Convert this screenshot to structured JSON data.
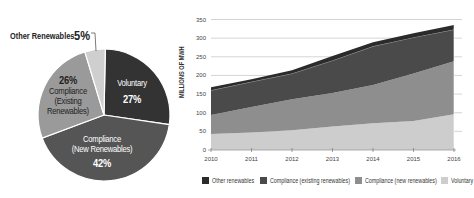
{
  "pie": {
    "slices": [
      {
        "name": "Voluntary",
        "label_lines": [
          "Voluntary"
        ],
        "percent": "27%",
        "value": 27,
        "color": "#333333"
      },
      {
        "name": "Compliance (New Renewables)",
        "label_lines": [
          "Compliance",
          "(New Renewables)"
        ],
        "percent": "42%",
        "value": 42,
        "color": "#555555"
      },
      {
        "name": "Compliance (Existing Renewables)",
        "label_lines": [
          "Compliance",
          "(Existing",
          "Renewables)"
        ],
        "percent": "26%",
        "value": 26,
        "color": "#9a9a9a"
      },
      {
        "name": "Other Renewables",
        "label_lines": [
          "Other Renewables"
        ],
        "percent": "5%",
        "value": 5,
        "color": "#cfcfcf"
      }
    ]
  },
  "area": {
    "ylabel": "MILLIONS OF MWH",
    "yticks": [
      "0",
      "50",
      "100",
      "150",
      "200",
      "250",
      "300",
      "350"
    ],
    "xticks": [
      "2010",
      "2011",
      "2012",
      "2013",
      "2014",
      "2015",
      "2016"
    ],
    "legend": [
      {
        "label": "Other renewables",
        "color": "#2b2b2b"
      },
      {
        "label": "Compliance (existing renewables)",
        "color": "#4a4a4a"
      },
      {
        "label": "Compliance (new renewables)",
        "color": "#8e8e8e"
      },
      {
        "label": "Voluntary",
        "color": "#cdcdcd"
      }
    ]
  },
  "chart_data": [
    {
      "type": "pie",
      "title": "",
      "categories": [
        "Voluntary",
        "Compliance (New Renewables)",
        "Compliance (Existing Renewables)",
        "Other Renewables"
      ],
      "values": [
        27,
        42,
        26,
        5
      ],
      "unit": "%"
    },
    {
      "type": "area",
      "stacked": true,
      "title": "",
      "xlabel": "",
      "ylabel": "MILLIONS OF MWH",
      "x": [
        2010,
        2011,
        2012,
        2013,
        2014,
        2015,
        2016
      ],
      "ylim": [
        0,
        350
      ],
      "yticks": [
        0,
        50,
        100,
        150,
        200,
        250,
        300,
        350
      ],
      "grid": "horizontal",
      "legend_position": "bottom",
      "series": [
        {
          "name": "Voluntary",
          "values": [
            43,
            47,
            53,
            63,
            72,
            78,
            96
          ]
        },
        {
          "name": "Compliance (new renewables)",
          "values": [
            51,
            68,
            83,
            90,
            102,
            127,
            142
          ]
        },
        {
          "name": "Compliance (existing renewables)",
          "values": [
            66,
            68,
            69,
            87,
            104,
            97,
            85
          ]
        },
        {
          "name": "Other renewables",
          "values": [
            8,
            7,
            9,
            12,
            11,
            11,
            12
          ]
        }
      ]
    }
  ]
}
